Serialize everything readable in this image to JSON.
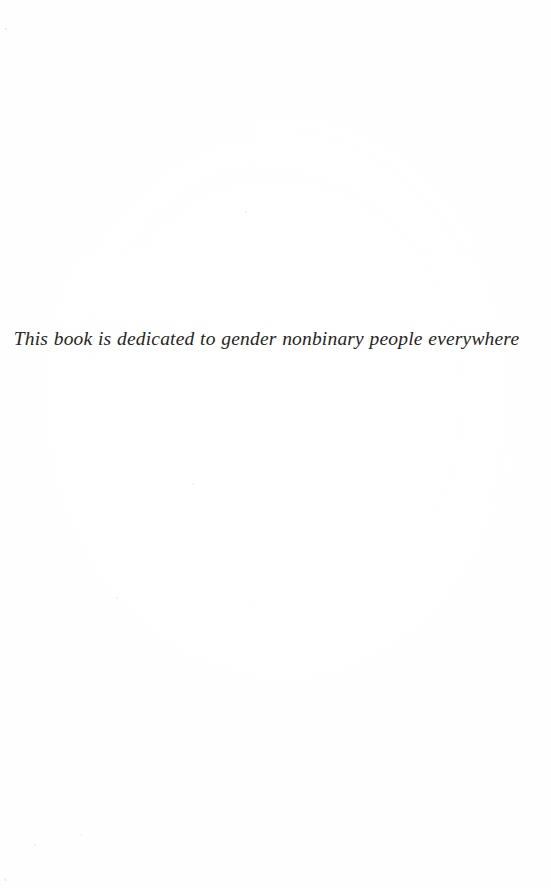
{
  "page": {
    "kind": "book-dedication-page",
    "width": 551,
    "height": 888,
    "background_color": "#fefefe",
    "ink_color": "#272524"
  },
  "dedication": {
    "text": "This book is dedicated to gender nonbinary people everywhere",
    "style": "italic-serif",
    "alignment": "center"
  },
  "artifacts": {
    "specks": [
      {
        "name": "speck-top-left",
        "x": 5,
        "y": 28,
        "size": 2.4,
        "color": "rgba(120,120,120,0.16)"
      },
      {
        "name": "speck-upper-mid",
        "x": 245,
        "y": 211,
        "size": 2.0,
        "color": "rgba(120,120,120,0.13)"
      },
      {
        "name": "speck-mid-right",
        "x": 192,
        "y": 483,
        "size": 1.8,
        "color": "rgba(120,120,120,0.10)"
      },
      {
        "name": "speck-lower-left",
        "x": 116,
        "y": 597,
        "size": 1.7,
        "color": "rgba(120,120,120,0.09)"
      },
      {
        "name": "speck-bottom-left",
        "x": 34,
        "y": 844,
        "size": 2.2,
        "color": "rgba(120,120,120,0.12)"
      },
      {
        "name": "speck-bottom-edge",
        "x": 4,
        "y": 878,
        "size": 3.0,
        "color": "rgba(120,120,120,0.10)"
      },
      {
        "name": "speck-bottom-mid",
        "x": 80,
        "y": 834,
        "size": 1.6,
        "color": "rgba(120,120,120,0.08)"
      }
    ]
  }
}
